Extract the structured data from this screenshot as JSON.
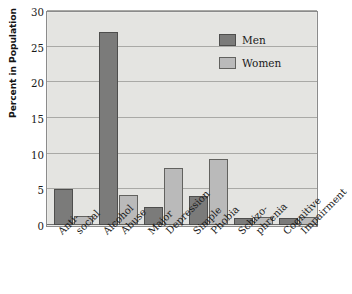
{
  "chart_data": {
    "type": "bar",
    "title": "",
    "subtitle": "",
    "xlabel": "",
    "ylabel": "Percent in Population",
    "ylim": [
      0,
      30
    ],
    "yticks": [
      0,
      5,
      10,
      15,
      20,
      25,
      30
    ],
    "grid": true,
    "legend_position": "top-right inside plot",
    "categories": [
      "Anti-social",
      "Alcohol Abuse",
      "Major Depression",
      "Simple Phobia",
      "Schizo-phrenia",
      "Cognitive Impairment"
    ],
    "category_lines": [
      [
        "Anti-",
        "social"
      ],
      [
        "Alcohol",
        "Abuse"
      ],
      [
        "Major",
        "Depression"
      ],
      [
        "Simple",
        "Phobia"
      ],
      [
        "Schizo-",
        "phrenia"
      ],
      [
        "Cognitive",
        "Impairment"
      ]
    ],
    "series": [
      {
        "name": "Men",
        "color": "#7b7b7a",
        "values": [
          5.1,
          27.0,
          2.5,
          4.1,
          1.0,
          1.0
        ]
      },
      {
        "name": "Women",
        "color": "#bababa",
        "values": [
          1.3,
          4.2,
          8.0,
          9.2,
          1.1,
          1.1
        ]
      }
    ]
  },
  "legend": {
    "items": [
      {
        "label": "Men",
        "swatch": "dark-gray-swatch"
      },
      {
        "label": "Women",
        "swatch": "light-gray-swatch"
      }
    ]
  },
  "axes": {
    "y_title": "Percent in Population",
    "y_tick_labels": [
      "0",
      "5",
      "10",
      "15",
      "20",
      "25",
      "30"
    ]
  },
  "colors": {
    "plot_background": "#e4e4e1",
    "grid": "#a9a9a6",
    "frame": "#8b8b8b",
    "men": "#7b7b7a",
    "women": "#bababa",
    "text": "#1a1a1a"
  }
}
